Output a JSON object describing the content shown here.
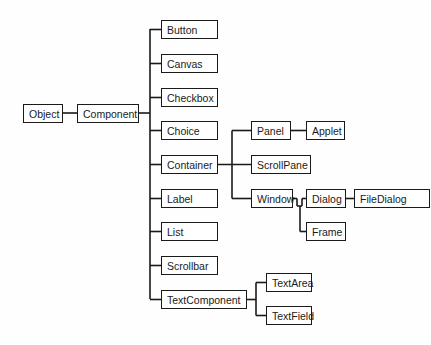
{
  "diagram": {
    "type": "class-hierarchy-tree",
    "line_color": "#1a1a1a",
    "box_border_color": "#1a1a1a",
    "box_fill": "#ffffff",
    "nodes": [
      {
        "id": "object",
        "label": "Object",
        "x": 23,
        "y": 104,
        "w": 40,
        "h": 19
      },
      {
        "id": "component",
        "label": "Component",
        "x": 77,
        "y": 104,
        "w": 62,
        "h": 19
      },
      {
        "id": "button",
        "label": "Button",
        "x": 161,
        "y": 20,
        "w": 57,
        "h": 19
      },
      {
        "id": "canvas",
        "label": "Canvas",
        "x": 161,
        "y": 54,
        "w": 57,
        "h": 19
      },
      {
        "id": "checkbox",
        "label": "Checkbox",
        "x": 161,
        "y": 88,
        "w": 57,
        "h": 19
      },
      {
        "id": "choice",
        "label": "Choice",
        "x": 161,
        "y": 121,
        "w": 57,
        "h": 19
      },
      {
        "id": "container",
        "label": "Container",
        "x": 161,
        "y": 155,
        "w": 57,
        "h": 19
      },
      {
        "id": "label",
        "label": "Label",
        "x": 161,
        "y": 189,
        "w": 57,
        "h": 19
      },
      {
        "id": "list",
        "label": "List",
        "x": 161,
        "y": 222,
        "w": 57,
        "h": 19
      },
      {
        "id": "scrollbar",
        "label": "Scrollbar",
        "x": 161,
        "y": 256,
        "w": 57,
        "h": 19
      },
      {
        "id": "textcomponent",
        "label": "TextComponent",
        "x": 161,
        "y": 290,
        "w": 86,
        "h": 19
      },
      {
        "id": "panel",
        "label": "Panel",
        "x": 251,
        "y": 121,
        "w": 40,
        "h": 19
      },
      {
        "id": "applet",
        "label": "Applet",
        "x": 306,
        "y": 121,
        "w": 39,
        "h": 19
      },
      {
        "id": "scrollpane",
        "label": "ScrollPane",
        "x": 251,
        "y": 155,
        "w": 60,
        "h": 19
      },
      {
        "id": "window",
        "label": "Window",
        "x": 251,
        "y": 189,
        "w": 42,
        "h": 19
      },
      {
        "id": "dialog",
        "label": "Dialog",
        "x": 306,
        "y": 189,
        "w": 40,
        "h": 19
      },
      {
        "id": "filedialog",
        "label": "FileDialog",
        "x": 354,
        "y": 189,
        "w": 76,
        "h": 19
      },
      {
        "id": "frame",
        "label": "Frame",
        "x": 306,
        "y": 222,
        "w": 40,
        "h": 19
      },
      {
        "id": "textarea",
        "label": "TextArea",
        "x": 266,
        "y": 273,
        "w": 46,
        "h": 19
      },
      {
        "id": "textfield",
        "label": "TextField",
        "x": 266,
        "y": 306,
        "w": 46,
        "h": 19
      }
    ],
    "edges": [
      {
        "from": "object",
        "to": "component"
      },
      {
        "from": "component",
        "to": "button"
      },
      {
        "from": "component",
        "to": "canvas"
      },
      {
        "from": "component",
        "to": "checkbox"
      },
      {
        "from": "component",
        "to": "choice"
      },
      {
        "from": "component",
        "to": "container"
      },
      {
        "from": "component",
        "to": "label"
      },
      {
        "from": "component",
        "to": "list"
      },
      {
        "from": "component",
        "to": "scrollbar"
      },
      {
        "from": "component",
        "to": "textcomponent"
      },
      {
        "from": "container",
        "to": "panel"
      },
      {
        "from": "container",
        "to": "scrollpane"
      },
      {
        "from": "container",
        "to": "window"
      },
      {
        "from": "panel",
        "to": "applet"
      },
      {
        "from": "window",
        "to": "dialog"
      },
      {
        "from": "window",
        "to": "frame"
      },
      {
        "from": "dialog",
        "to": "filedialog"
      },
      {
        "from": "textcomponent",
        "to": "textarea"
      },
      {
        "from": "textcomponent",
        "to": "textfield"
      }
    ]
  }
}
